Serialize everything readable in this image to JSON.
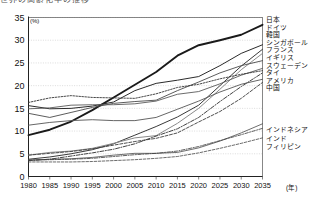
{
  "title_strip": "世界の高齢化率の推移",
  "axes": {
    "y_unit": "(%)",
    "x_unit": "(年)",
    "yticks": [
      0,
      5,
      10,
      15,
      20,
      25,
      30,
      35
    ],
    "xticks": [
      1980,
      1985,
      1990,
      1995,
      2000,
      2005,
      2010,
      2015,
      2020,
      2025,
      2030,
      2035
    ]
  },
  "legend": {
    "top_group": [
      "日本",
      "ドイツ",
      "韓国",
      "シンガポール",
      "フランス",
      "イギリス",
      "スウェーデン",
      "タイ",
      "アメリカ",
      "中国"
    ],
    "bottom_group": [
      "インドネシア",
      "インド",
      "フィリピン"
    ]
  },
  "chart_data": {
    "type": "line",
    "title": "世界の高齢化率の推移",
    "xlabel": "(年)",
    "ylabel": "(%)",
    "xlim": [
      1980,
      2035
    ],
    "ylim": [
      0,
      35
    ],
    "grid": true,
    "legend_position": "right",
    "x": [
      1980,
      1985,
      1990,
      1995,
      2000,
      2005,
      2010,
      2015,
      2020,
      2025,
      2030,
      2035
    ],
    "series": [
      {
        "name": "日本",
        "style": "solid-thick",
        "color": "#1a1a1a",
        "width": 1.9,
        "dash": "none",
        "values": [
          9.1,
          10.3,
          12.1,
          14.6,
          17.4,
          20.2,
          23.0,
          26.6,
          28.9,
          30.0,
          31.2,
          33.4
        ]
      },
      {
        "name": "ドイツ",
        "style": "solid",
        "color": "#2b2b2b",
        "width": 1.0,
        "dash": "none",
        "values": [
          15.6,
          14.9,
          15.0,
          15.5,
          16.4,
          18.9,
          20.5,
          21.2,
          22.0,
          24.4,
          27.1,
          29.0
        ]
      },
      {
        "name": "韓国",
        "style": "solid",
        "color": "#3a3a3a",
        "width": 1.0,
        "dash": "none",
        "values": [
          3.8,
          4.3,
          5.0,
          5.9,
          7.2,
          9.1,
          11.0,
          13.1,
          15.7,
          20.0,
          24.3,
          28.0
        ]
      },
      {
        "name": "シンガポール",
        "style": "solid-light",
        "color": "#8a8a8a",
        "width": 1.0,
        "dash": "none",
        "values": [
          4.7,
          5.3,
          5.6,
          6.2,
          7.3,
          8.5,
          9.0,
          11.7,
          15.0,
          19.2,
          23.5,
          27.1
        ]
      },
      {
        "name": "フランス",
        "style": "solid",
        "color": "#4a4a4a",
        "width": 0.9,
        "dash": "none",
        "values": [
          13.9,
          13.0,
          14.1,
          15.2,
          16.1,
          16.5,
          16.8,
          18.9,
          20.8,
          22.8,
          24.4,
          25.5
        ]
      },
      {
        "name": "イギリス",
        "style": "solid",
        "color": "#5a5a5a",
        "width": 0.9,
        "dash": "none",
        "values": [
          14.9,
          15.1,
          15.7,
          15.8,
          15.8,
          16.0,
          16.6,
          18.1,
          18.7,
          20.4,
          22.3,
          23.8
        ]
      },
      {
        "name": "スウェーデン",
        "style": "dotted",
        "color": "#333333",
        "width": 0.9,
        "dash": "1.6 1.4",
        "values": [
          16.3,
          17.3,
          17.8,
          17.4,
          17.3,
          17.2,
          18.2,
          19.6,
          20.3,
          21.5,
          22.5,
          23.3
        ]
      },
      {
        "name": "タイ",
        "style": "dashdot",
        "color": "#2e2e2e",
        "width": 0.9,
        "dash": "4 1.5 1 1.5",
        "values": [
          3.5,
          3.8,
          4.5,
          5.2,
          6.0,
          7.2,
          8.9,
          10.5,
          13.0,
          16.5,
          19.8,
          22.8
        ]
      },
      {
        "name": "アメリカ",
        "style": "solid",
        "color": "#555555",
        "width": 0.9,
        "dash": "none",
        "values": [
          11.3,
          11.9,
          12.3,
          12.5,
          12.3,
          12.3,
          13.0,
          14.8,
          16.6,
          18.6,
          20.3,
          21.4
        ]
      },
      {
        "name": "中国",
        "style": "dashed",
        "color": "#3d3d3d",
        "width": 0.9,
        "dash": "3 1.6",
        "values": [
          4.7,
          5.1,
          5.5,
          6.1,
          6.9,
          7.7,
          8.4,
          9.6,
          12.0,
          14.3,
          17.2,
          20.7
        ]
      },
      {
        "name": "インドネシア",
        "style": "solid",
        "color": "#4a4a4a",
        "width": 0.8,
        "dash": "none",
        "values": [
          3.6,
          3.8,
          3.9,
          4.2,
          4.7,
          5.1,
          5.1,
          5.3,
          6.3,
          7.8,
          9.6,
          11.6
        ]
      },
      {
        "name": "インド",
        "style": "dashdot",
        "color": "#3a3a3a",
        "width": 0.8,
        "dash": "3.5 1.4 1 1.4",
        "values": [
          3.6,
          3.7,
          3.8,
          4.0,
          4.4,
          4.8,
          5.1,
          5.6,
          6.6,
          7.9,
          9.2,
          10.6
        ]
      },
      {
        "name": "フィリピン",
        "style": "dashed",
        "color": "#474747",
        "width": 0.8,
        "dash": "2.6 1.5",
        "values": [
          3.2,
          3.2,
          3.2,
          3.3,
          3.5,
          3.7,
          4.0,
          4.4,
          5.2,
          6.2,
          7.3,
          8.5
        ]
      }
    ]
  }
}
